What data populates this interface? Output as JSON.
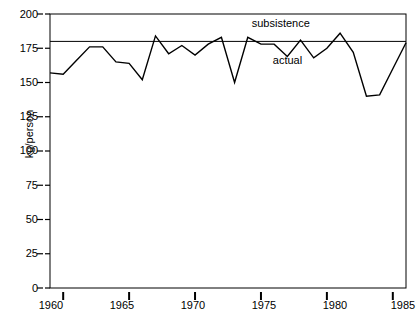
{
  "chart_data": {
    "type": "line",
    "title": "",
    "subtitle": "",
    "xlabel": "",
    "ylabel": "kg/person",
    "xlim": [
      1959,
      1986
    ],
    "ylim": [
      0,
      200
    ],
    "grid": false,
    "legend_position": "inline-annotations",
    "x_ticks": [
      1960,
      1965,
      1970,
      1975,
      1980,
      1985
    ],
    "x_tick_labels": [
      "1960",
      "1965",
      "1970",
      "1975",
      "1980",
      "1985"
    ],
    "y_ticks": [
      0,
      25,
      50,
      75,
      100,
      125,
      150,
      175,
      200
    ],
    "y_tick_labels": [
      "0",
      "25",
      "50",
      "75",
      "100",
      "125",
      "150",
      "175",
      "200"
    ],
    "annotations": [
      {
        "text": "subsistence",
        "x": 1976.5,
        "y": 193
      },
      {
        "text": "actual",
        "x": 1977.0,
        "y": 166
      }
    ],
    "x": [
      1959,
      1960,
      1961,
      1962,
      1963,
      1964,
      1965,
      1966,
      1967,
      1968,
      1969,
      1970,
      1971,
      1972,
      1973,
      1974,
      1975,
      1976,
      1977,
      1978,
      1979,
      1980,
      1981,
      1982,
      1983,
      1984,
      1985,
      1986
    ],
    "series": [
      {
        "name": "actual",
        "color": "#000000",
        "values": [
          157,
          156,
          166,
          176,
          176,
          165,
          164,
          152,
          184,
          171,
          177,
          170,
          178,
          183,
          150,
          183,
          178,
          178,
          169,
          181,
          168,
          175,
          186,
          172,
          140,
          141,
          160,
          179
        ]
      },
      {
        "name": "subsistence",
        "color": "#000000",
        "constant": 180,
        "values": [
          180,
          180,
          180,
          180,
          180,
          180,
          180,
          180,
          180,
          180,
          180,
          180,
          180,
          180,
          180,
          180,
          180,
          180,
          180,
          180,
          180,
          180,
          180,
          180,
          180,
          180,
          180,
          180
        ]
      }
    ]
  },
  "axis": {
    "y_label": "kg/person",
    "y_tick_labels": [
      "200",
      "175",
      "150",
      "125",
      "100",
      "75",
      "50",
      "25",
      "0"
    ],
    "x_tick_labels": [
      "1960",
      "1965",
      "1970",
      "1975",
      "1980",
      "1985"
    ]
  },
  "labels": {
    "subsistence": "subsistence",
    "actual": "actual"
  },
  "colors": {
    "line": "#000000",
    "axis": "#000000",
    "background": "#ffffff"
  }
}
